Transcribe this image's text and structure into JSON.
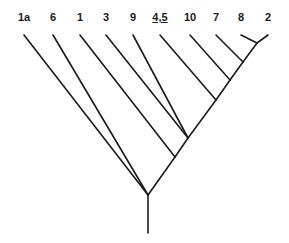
{
  "diagram": {
    "type": "cladogram",
    "line_color": "#1a1a1a",
    "leaves": [
      {
        "id": "1a",
        "label": "1a",
        "x": 24,
        "y": 27,
        "underline": false
      },
      {
        "id": "6",
        "label": "6",
        "x": 53,
        "y": 27,
        "underline": false
      },
      {
        "id": "1",
        "label": "1",
        "x": 80,
        "y": 27,
        "underline": false
      },
      {
        "id": "3",
        "label": "3",
        "x": 106,
        "y": 27,
        "underline": false
      },
      {
        "id": "9",
        "label": "9",
        "x": 133,
        "y": 27,
        "underline": false
      },
      {
        "id": "4,5",
        "label": "4,5",
        "x": 160,
        "y": 27,
        "underline": true
      },
      {
        "id": "10",
        "label": "10",
        "x": 190,
        "y": 27,
        "underline": false
      },
      {
        "id": "7",
        "label": "7",
        "x": 216,
        "y": 27,
        "underline": false
      },
      {
        "id": "8",
        "label": "8",
        "x": 241,
        "y": 27,
        "underline": false
      },
      {
        "id": "2",
        "label": "2",
        "x": 268,
        "y": 27,
        "underline": false
      }
    ],
    "nodes": [
      {
        "id": "root",
        "x": 148,
        "y": 195
      },
      {
        "id": "n1",
        "x": 175,
        "y": 157
      },
      {
        "id": "n39",
        "x": 188,
        "y": 138
      },
      {
        "id": "n45",
        "x": 216,
        "y": 100
      },
      {
        "id": "n10",
        "x": 230,
        "y": 80
      },
      {
        "id": "n7",
        "x": 243,
        "y": 62
      },
      {
        "id": "n82",
        "x": 257,
        "y": 43
      }
    ],
    "stem": {
      "x": 148,
      "y1": 195,
      "y2": 233
    },
    "edges": [
      [
        "root",
        "1a"
      ],
      [
        "root",
        "6"
      ],
      [
        "root",
        "n1"
      ],
      [
        "n1",
        "1"
      ],
      [
        "n1",
        "n39"
      ],
      [
        "n39",
        "3"
      ],
      [
        "n39",
        "9"
      ],
      [
        "n39",
        "n45"
      ],
      [
        "n45",
        "4,5"
      ],
      [
        "n45",
        "n10"
      ],
      [
        "n10",
        "10"
      ],
      [
        "n10",
        "n7"
      ],
      [
        "n7",
        "7"
      ],
      [
        "n7",
        "n82"
      ],
      [
        "n82",
        "8"
      ],
      [
        "n82",
        "2"
      ]
    ]
  }
}
